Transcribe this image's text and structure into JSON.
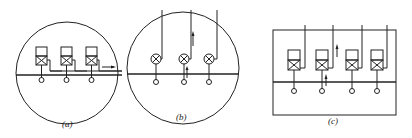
{
  "figure": {
    "panels": [
      {
        "id": "a",
        "caption": "(a)",
        "shape": "circle",
        "units": 3,
        "unit_type": "box-with-crossed-square",
        "flow_arrow": "right"
      },
      {
        "id": "b",
        "caption": "(b)",
        "shape": "circle",
        "units": 3,
        "unit_type": "crossed-circle",
        "flow_arrow": "up"
      },
      {
        "id": "c",
        "caption": "(c)",
        "shape": "rectangle",
        "units": 4,
        "unit_type": "box-with-crossed-square",
        "flow_arrow": "up"
      }
    ],
    "colors": {
      "stroke": "#222222",
      "background": "#ffffff"
    }
  }
}
